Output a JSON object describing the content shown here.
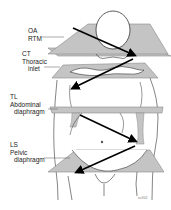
{
  "figure": {
    "colors": {
      "plane_fill": "#c4c4c4",
      "plane_stroke": "#8a8a8a",
      "outline": "#333333",
      "arrow": "#000000",
      "background": "#ffffff"
    },
    "labels": [
      {
        "id": "oa",
        "lines": [
          "OA",
          "RTM"
        ]
      },
      {
        "id": "ct",
        "lines": [
          "CT",
          "Thoracic",
          "inlet"
        ]
      },
      {
        "id": "tl",
        "lines": [
          "TL",
          "Abdominal",
          "diaphragm"
        ]
      },
      {
        "id": "ls",
        "lines": [
          "LS",
          "Pelvic",
          "diaphragm"
        ]
      }
    ],
    "credit": "ncl/02"
  }
}
